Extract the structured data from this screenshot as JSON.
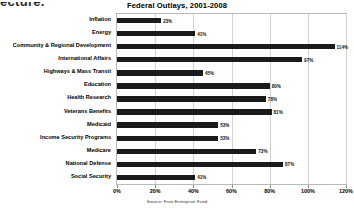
{
  "bleed_text": "ecture.",
  "chart_data": {
    "type": "bar",
    "orientation": "horizontal",
    "title": "Federal Outlays, 2001-2008",
    "source": "Source: Free Enterprise Fund",
    "xlabel": "",
    "ylabel": "",
    "xlim": [
      0,
      120
    ],
    "grid": true,
    "legend": "none",
    "bar_color": "#1a1a1a",
    "xticks": [
      "0%",
      "20%",
      "40%",
      "60%",
      "80%",
      "100%",
      "120%"
    ],
    "xtick_values": [
      0,
      20,
      40,
      60,
      80,
      100,
      120
    ],
    "categories": [
      "Inflation",
      "Energy",
      "Community & Regional Development",
      "International Affairs",
      "Highways & Mass Transit",
      "Education",
      "Health Research",
      "Veterans Benefits",
      "Medicaid",
      "Income Security Programs",
      "Medicare",
      "National Defense",
      "Social Security"
    ],
    "values": [
      23,
      41,
      114,
      97,
      45,
      80,
      78,
      81,
      53,
      53,
      73,
      87,
      41
    ],
    "labels": [
      "23%",
      "41%",
      "114%",
      "97%",
      "45%",
      "80%",
      "78%",
      "81%",
      "53%",
      "53%",
      "73%",
      "87%",
      "41%"
    ]
  }
}
